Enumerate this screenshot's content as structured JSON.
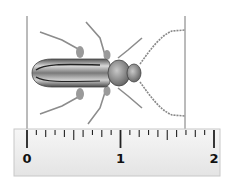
{
  "ruler": {
    "start_value": 0,
    "end_value": 2,
    "labels": [
      "0",
      "1",
      "2"
    ],
    "minor_step": 0.1,
    "medium_step": 0.5,
    "major_step": 1
  },
  "measurement": {
    "left_line_value": 0,
    "right_line_value": 1.69,
    "note": "Vertical lines mark the beetle's extent from tail to antenna tips"
  },
  "colors": {
    "ruler_fill": "#eeeeee",
    "ruler_border": "#c8c8c8",
    "tick": "#222222",
    "measure_line": "#777777",
    "beetle_body": "#8a8a8a",
    "beetle_dark": "#3a3a3a"
  }
}
